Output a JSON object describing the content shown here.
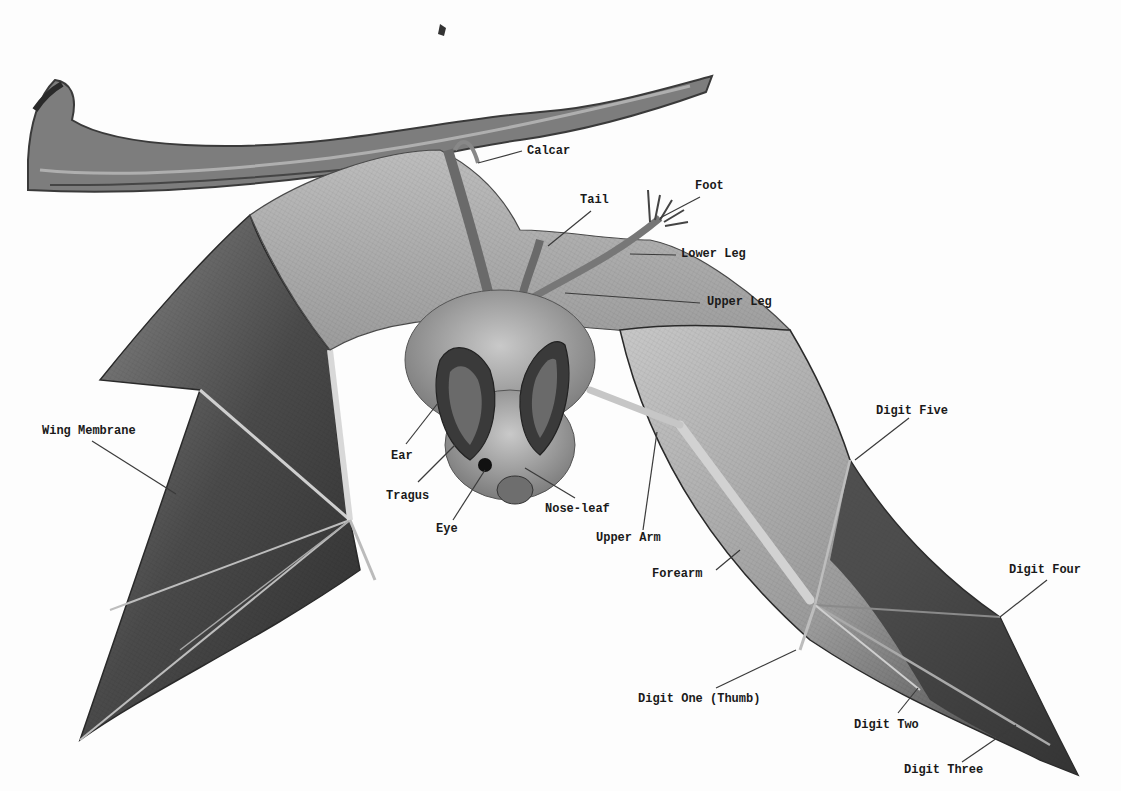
{
  "figure": {
    "labels": [
      {
        "id": "calcar",
        "text": "Calcar",
        "x": 527,
        "y": 144
      },
      {
        "id": "foot",
        "text": "Foot",
        "x": 695,
        "y": 179
      },
      {
        "id": "tail",
        "text": "Tail",
        "x": 580,
        "y": 193
      },
      {
        "id": "lower-leg",
        "text": "Lower Leg",
        "x": 681,
        "y": 247
      },
      {
        "id": "upper-leg",
        "text": "Upper Leg",
        "x": 707,
        "y": 295
      },
      {
        "id": "wing-membrane",
        "text": "Wing Membrane",
        "x": 42,
        "y": 424
      },
      {
        "id": "digit-five",
        "text": "Digit Five",
        "x": 876,
        "y": 404
      },
      {
        "id": "ear",
        "text": "Ear",
        "x": 391,
        "y": 449
      },
      {
        "id": "tragus",
        "text": "Tragus",
        "x": 386,
        "y": 489
      },
      {
        "id": "nose-leaf",
        "text": "Nose-leaf",
        "x": 545,
        "y": 502
      },
      {
        "id": "eye",
        "text": "Eye",
        "x": 436,
        "y": 522
      },
      {
        "id": "upper-arm",
        "text": "Upper Arm",
        "x": 596,
        "y": 531
      },
      {
        "id": "forearm",
        "text": "Forearm",
        "x": 652,
        "y": 567
      },
      {
        "id": "digit-four",
        "text": "Digit Four",
        "x": 1009,
        "y": 563
      },
      {
        "id": "digit-one-thumb",
        "text": "Digit One (Thumb)",
        "x": 638,
        "y": 692
      },
      {
        "id": "digit-two",
        "text": "Digit Two",
        "x": 854,
        "y": 718
      },
      {
        "id": "digit-three",
        "text": "Digit Three",
        "x": 904,
        "y": 763
      }
    ],
    "leaders": [
      {
        "id": "calcar",
        "x1": 522,
        "y1": 151,
        "x2": 478,
        "y2": 163
      },
      {
        "id": "foot",
        "x1": 700,
        "y1": 197,
        "x2": 660,
        "y2": 218
      },
      {
        "id": "tail",
        "x1": 591,
        "y1": 211,
        "x2": 548,
        "y2": 246
      },
      {
        "id": "lower-leg",
        "x1": 676,
        "y1": 255,
        "x2": 630,
        "y2": 254
      },
      {
        "id": "upper-leg",
        "x1": 700,
        "y1": 303,
        "x2": 565,
        "y2": 293
      },
      {
        "id": "wing-membrane",
        "x1": 92,
        "y1": 441,
        "x2": 176,
        "y2": 494
      },
      {
        "id": "digit-five",
        "x1": 909,
        "y1": 418,
        "x2": 855,
        "y2": 460
      },
      {
        "id": "ear",
        "x1": 406,
        "y1": 444,
        "x2": 438,
        "y2": 403
      },
      {
        "id": "tragus",
        "x1": 418,
        "y1": 482,
        "x2": 455,
        "y2": 445
      },
      {
        "id": "nose-leaf",
        "x1": 575,
        "y1": 498,
        "x2": 525,
        "y2": 468
      },
      {
        "id": "eye",
        "x1": 453,
        "y1": 520,
        "x2": 485,
        "y2": 470
      },
      {
        "id": "upper-arm",
        "x1": 643,
        "y1": 530,
        "x2": 657,
        "y2": 432
      },
      {
        "id": "forearm",
        "x1": 716,
        "y1": 570,
        "x2": 740,
        "y2": 550
      },
      {
        "id": "digit-four",
        "x1": 1047,
        "y1": 580,
        "x2": 1000,
        "y2": 617
      },
      {
        "id": "digit-one-thumb",
        "x1": 716,
        "y1": 688,
        "x2": 796,
        "y2": 650
      },
      {
        "id": "digit-two",
        "x1": 898,
        "y1": 713,
        "x2": 918,
        "y2": 688
      },
      {
        "id": "digit-three",
        "x1": 962,
        "y1": 762,
        "x2": 1016,
        "y2": 725
      }
    ],
    "colors": {
      "background": "#fdfdfd",
      "label_text": "#1a1a1a",
      "leader_line": "#3a3a3a",
      "membrane_dark": "#3c3c3c",
      "membrane_mid": "#7a7a7a",
      "membrane_light": "#b8b8b8",
      "body_fur": "#9a9a9a",
      "branch": "#6e6e6e"
    }
  }
}
